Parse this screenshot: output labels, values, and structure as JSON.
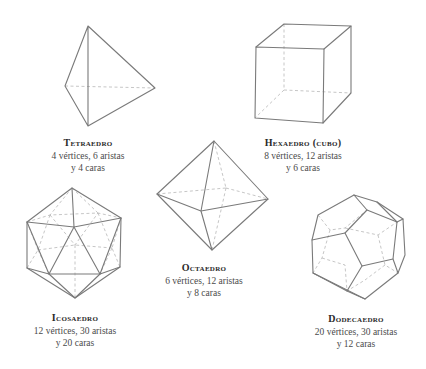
{
  "solids": [
    {
      "id": "tetraedro",
      "name": "Tetraedro",
      "line1": "4 vértices, 6 aristas",
      "line2": "y 4 caras"
    },
    {
      "id": "hexaedro",
      "name": "Hexaedro (cubo)",
      "line1": "8 vértices, 12 aristas",
      "line2": "y 6 caras"
    },
    {
      "id": "octaedro",
      "name": "Octaedro",
      "line1": "6 vértices, 12 aristas",
      "line2": "y 8 caras"
    },
    {
      "id": "icosaedro",
      "name": "Icosaedro",
      "line1": "12 vértices, 30 aristas",
      "line2": "y 20 caras"
    },
    {
      "id": "dodecaedro",
      "name": "Dodecaedro",
      "line1": "20 vértices, 30 aristas",
      "line2": "y 12 caras"
    }
  ],
  "colors": {
    "edge": "#7a7a7a",
    "hidden_edge": "#b8b8b8",
    "background": "#ffffff"
  }
}
